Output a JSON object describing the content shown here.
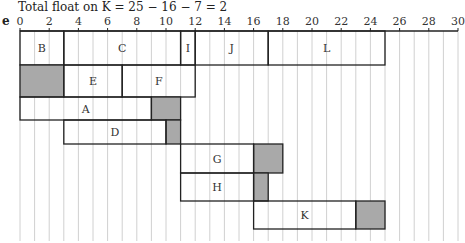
{
  "caption": "Total float on K = 25 − 16 − 7 = 2",
  "part_label": "e",
  "colors": {
    "bar_border": "#222222",
    "float_fill": "#a9a9a9",
    "grid": "#d0d0d0"
  },
  "chart_data": {
    "type": "cascade-gantt",
    "title": "Total float on K = 25 − 16 − 7 = 2",
    "xlim": [
      0,
      30
    ],
    "ticks": [
      0,
      2,
      4,
      6,
      8,
      10,
      12,
      14,
      16,
      18,
      20,
      22,
      24,
      26,
      28,
      30
    ],
    "grid": "vertical every 1 unit",
    "rows": [
      {
        "activities": [
          {
            "label": "B",
            "start": 0,
            "end": 3
          },
          {
            "label": "C",
            "start": 3,
            "end": 11
          },
          {
            "label": "I",
            "start": 11,
            "end": 12
          },
          {
            "label": "J",
            "start": 12,
            "end": 17
          },
          {
            "label": "L",
            "start": 17,
            "end": 25
          }
        ],
        "floats": []
      },
      {
        "activities": [
          {
            "label": "E",
            "start": 3,
            "end": 7
          },
          {
            "label": "F",
            "start": 7,
            "end": 12
          }
        ],
        "floats": [
          {
            "start": 0,
            "end": 3
          }
        ]
      },
      {
        "activities": [
          {
            "label": "A",
            "start": 0,
            "end": 9
          }
        ],
        "floats": [
          {
            "start": 9,
            "end": 11
          }
        ]
      },
      {
        "activities": [
          {
            "label": "D",
            "start": 3,
            "end": 10
          }
        ],
        "floats": [
          {
            "start": 10,
            "end": 11
          }
        ]
      },
      {
        "activities": [
          {
            "label": "G",
            "start": 11,
            "end": 16
          }
        ],
        "floats": [
          {
            "start": 16,
            "end": 18
          }
        ]
      },
      {
        "activities": [
          {
            "label": "H",
            "start": 11,
            "end": 16
          }
        ],
        "floats": [
          {
            "start": 16,
            "end": 17
          }
        ]
      },
      {
        "activities": [
          {
            "label": "K",
            "start": 16,
            "end": 23
          }
        ],
        "floats": [
          {
            "start": 23,
            "end": 25
          }
        ]
      }
    ]
  }
}
